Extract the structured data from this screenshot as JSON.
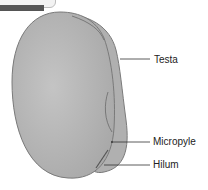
{
  "diagram": {
    "labels": [
      {
        "text": "Testa",
        "x": 154,
        "y": 55
      },
      {
        "text": "Micropyle",
        "x": 153,
        "y": 137
      },
      {
        "text": "Hilum",
        "x": 153,
        "y": 160
      }
    ]
  },
  "colors": {
    "seed_fill": "#b8b8b8",
    "seed_outline": "#7a7a7a",
    "leader_line": "#333333"
  }
}
